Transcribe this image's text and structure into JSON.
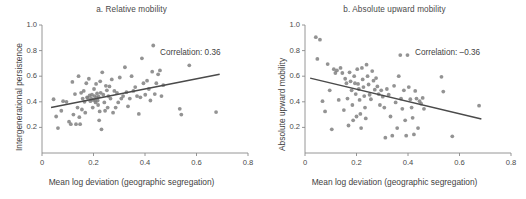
{
  "figure": {
    "background": "#ffffff",
    "point_color": "#808080",
    "line_color": "#4a4a4a",
    "axis_color": "#8a8a8a",
    "text_color": "#3f3f3f"
  },
  "panels": [
    {
      "id": "a",
      "title": "a. Relative mobility",
      "annotation": "Correlation: 0.36",
      "xlabel": "Mean log deviation (geographic segregation)",
      "ylabel": "Intergenerational persistence",
      "xticks": [
        "0",
        "0.2",
        "0.4",
        "0.6",
        "0.8"
      ],
      "yticks": [
        "0.2",
        "0.4",
        "0.6",
        "0.8",
        "1.0"
      ]
    },
    {
      "id": "b",
      "title": "b. Absolute upward mobility",
      "annotation": "Correlation: –0.36",
      "xlabel": "Mean log deviation (geographic segregation)",
      "ylabel": "Absolute upward mobility",
      "xticks": [
        "0",
        "0.2",
        "0.4",
        "0.6",
        "0.8"
      ],
      "yticks": [
        "0.2",
        "0.4",
        "0.6",
        "0.8",
        "1.0"
      ]
    }
  ],
  "chart_data": [
    {
      "type": "scatter",
      "title": "a. Relative mobility",
      "xlabel": "Mean log deviation (geographic segregation)",
      "ylabel": "Intergenerational persistence",
      "xlim": [
        0,
        0.8
      ],
      "ylim": [
        0,
        1.0
      ],
      "xticks": [
        0,
        0.2,
        0.4,
        0.6,
        0.8
      ],
      "yticks": [
        0.2,
        0.4,
        0.6,
        0.8,
        1.0
      ],
      "grid": false,
      "legend": "none",
      "annotation": "Correlation: 0.36",
      "correlation": 0.36,
      "trendline": {
        "x": [
          0.035,
          0.69
        ],
        "y": [
          0.355,
          0.615
        ]
      },
      "points": [
        [
          0.045,
          0.42
        ],
        [
          0.055,
          0.285
        ],
        [
          0.062,
          0.195
        ],
        [
          0.075,
          0.33
        ],
        [
          0.082,
          0.405
        ],
        [
          0.095,
          0.4
        ],
        [
          0.105,
          0.245
        ],
        [
          0.112,
          0.225
        ],
        [
          0.118,
          0.555
        ],
        [
          0.122,
          0.3
        ],
        [
          0.128,
          0.46
        ],
        [
          0.132,
          0.225
        ],
        [
          0.138,
          0.355
        ],
        [
          0.142,
          0.6
        ],
        [
          0.145,
          0.28
        ],
        [
          0.148,
          0.225
        ],
        [
          0.152,
          0.47
        ],
        [
          0.155,
          0.34
        ],
        [
          0.158,
          0.425
        ],
        [
          0.162,
          0.485
        ],
        [
          0.165,
          0.4
        ],
        [
          0.168,
          0.315
        ],
        [
          0.172,
          0.545
        ],
        [
          0.175,
          0.435
        ],
        [
          0.178,
          0.43
        ],
        [
          0.182,
          0.58
        ],
        [
          0.185,
          0.45
        ],
        [
          0.188,
          0.405
        ],
        [
          0.191,
          0.425
        ],
        [
          0.194,
          0.455
        ],
        [
          0.197,
          0.355
        ],
        [
          0.199,
          0.415
        ],
        [
          0.202,
          0.5
        ],
        [
          0.204,
          0.445
        ],
        [
          0.206,
          0.41
        ],
        [
          0.208,
          0.395
        ],
        [
          0.21,
          0.54
        ],
        [
          0.212,
          0.435
        ],
        [
          0.214,
          0.465
        ],
        [
          0.216,
          0.41
        ],
        [
          0.218,
          0.375
        ],
        [
          0.22,
          0.44
        ],
        [
          0.222,
          0.255
        ],
        [
          0.224,
          0.325
        ],
        [
          0.226,
          0.56
        ],
        [
          0.228,
          0.47
        ],
        [
          0.231,
          0.185
        ],
        [
          0.234,
          0.63
        ],
        [
          0.238,
          0.455
        ],
        [
          0.242,
          0.395
        ],
        [
          0.245,
          0.33
        ],
        [
          0.248,
          0.525
        ],
        [
          0.252,
          0.49
        ],
        [
          0.255,
          0.355
        ],
        [
          0.258,
          0.445
        ],
        [
          0.262,
          0.52
        ],
        [
          0.266,
          0.425
        ],
        [
          0.271,
          0.575
        ],
        [
          0.276,
          0.315
        ],
        [
          0.281,
          0.485
        ],
        [
          0.286,
          0.355
        ],
        [
          0.291,
          0.47
        ],
        [
          0.296,
          0.395
        ],
        [
          0.302,
          0.59
        ],
        [
          0.308,
          0.425
        ],
        [
          0.315,
          0.445
        ],
        [
          0.322,
          0.67
        ],
        [
          0.328,
          0.475
        ],
        [
          0.334,
          0.365
        ],
        [
          0.341,
          0.425
        ],
        [
          0.348,
          0.6
        ],
        [
          0.355,
          0.485
        ],
        [
          0.362,
          0.515
        ],
        [
          0.369,
          0.445
        ],
        [
          0.376,
          0.305
        ],
        [
          0.382,
          0.435
        ],
        [
          0.388,
          0.74
        ],
        [
          0.394,
          0.545
        ],
        [
          0.401,
          0.455
        ],
        [
          0.408,
          0.565
        ],
        [
          0.415,
          0.5
        ],
        [
          0.421,
          0.41
        ],
        [
          0.428,
          0.635
        ],
        [
          0.432,
          0.84
        ],
        [
          0.438,
          0.46
        ],
        [
          0.444,
          0.545
        ],
        [
          0.451,
          0.615
        ],
        [
          0.458,
          0.645
        ],
        [
          0.464,
          0.445
        ],
        [
          0.471,
          0.53
        ],
        [
          0.535,
          0.345
        ],
        [
          0.541,
          0.3
        ],
        [
          0.572,
          0.685
        ],
        [
          0.676,
          0.32
        ]
      ]
    },
    {
      "type": "scatter",
      "title": "b. Absolute upward mobility",
      "xlabel": "Mean log deviation (geographic segregation)",
      "ylabel": "Absolute upward mobility",
      "xlim": [
        0,
        0.8
      ],
      "ylim": [
        0,
        1.0
      ],
      "xticks": [
        0,
        0.2,
        0.4,
        0.6,
        0.8
      ],
      "yticks": [
        0.2,
        0.4,
        0.6,
        0.8,
        1.0
      ],
      "grid": false,
      "legend": "none",
      "annotation": "Correlation: –0.36",
      "correlation": -0.36,
      "trendline": {
        "x": [
          0.02,
          0.685
        ],
        "y": [
          0.585,
          0.265
        ]
      },
      "points": [
        [
          0.042,
          0.905
        ],
        [
          0.048,
          0.735
        ],
        [
          0.058,
          0.885
        ],
        [
          0.068,
          0.405
        ],
        [
          0.078,
          0.325
        ],
        [
          0.088,
          0.695
        ],
        [
          0.096,
          0.49
        ],
        [
          0.104,
          0.185
        ],
        [
          0.112,
          0.655
        ],
        [
          0.118,
          0.625
        ],
        [
          0.124,
          0.645
        ],
        [
          0.131,
          0.415
        ],
        [
          0.138,
          0.665
        ],
        [
          0.145,
          0.625
        ],
        [
          0.151,
          0.335
        ],
        [
          0.156,
          0.58
        ],
        [
          0.161,
          0.545
        ],
        [
          0.165,
          0.425
        ],
        [
          0.169,
          0.215
        ],
        [
          0.173,
          0.63
        ],
        [
          0.177,
          0.56
        ],
        [
          0.181,
          0.49
        ],
        [
          0.184,
          0.375
        ],
        [
          0.187,
          0.255
        ],
        [
          0.191,
          0.6
        ],
        [
          0.194,
          0.545
        ],
        [
          0.197,
          0.46
        ],
        [
          0.2,
          0.285
        ],
        [
          0.203,
          0.655
        ],
        [
          0.206,
          0.54
        ],
        [
          0.209,
          0.5
        ],
        [
          0.212,
          0.415
        ],
        [
          0.215,
          0.305
        ],
        [
          0.218,
          0.195
        ],
        [
          0.221,
          0.665
        ],
        [
          0.224,
          0.575
        ],
        [
          0.227,
          0.515
        ],
        [
          0.23,
          0.445
        ],
        [
          0.233,
          0.355
        ],
        [
          0.236,
          0.27
        ],
        [
          0.239,
          0.69
        ],
        [
          0.243,
          0.6
        ],
        [
          0.247,
          0.535
        ],
        [
          0.251,
          0.455
        ],
        [
          0.256,
          0.42
        ],
        [
          0.261,
          0.64
        ],
        [
          0.266,
          0.565
        ],
        [
          0.271,
          0.495
        ],
        [
          0.276,
          0.585
        ],
        [
          0.281,
          0.52
        ],
        [
          0.286,
          0.46
        ],
        [
          0.291,
          0.375
        ],
        [
          0.296,
          0.49
        ],
        [
          0.302,
          0.44
        ],
        [
          0.308,
          0.355
        ],
        [
          0.312,
          0.12
        ],
        [
          0.318,
          0.5
        ],
        [
          0.325,
          0.455
        ],
        [
          0.332,
          0.285
        ],
        [
          0.339,
          0.135
        ],
        [
          0.346,
          0.525
        ],
        [
          0.352,
          0.395
        ],
        [
          0.358,
          0.195
        ],
        [
          0.364,
          0.6
        ],
        [
          0.37,
          0.765
        ],
        [
          0.373,
          0.425
        ],
        [
          0.378,
          0.345
        ],
        [
          0.384,
          0.49
        ],
        [
          0.389,
          0.255
        ],
        [
          0.393,
          0.135
        ],
        [
          0.398,
          0.765
        ],
        [
          0.403,
          0.515
        ],
        [
          0.409,
          0.42
        ],
        [
          0.414,
          0.355
        ],
        [
          0.418,
          0.275
        ],
        [
          0.423,
          0.145
        ],
        [
          0.428,
          0.485
        ],
        [
          0.433,
          0.425
        ],
        [
          0.439,
          0.195
        ],
        [
          0.445,
          0.405
        ],
        [
          0.451,
          0.385
        ],
        [
          0.457,
          0.43
        ],
        [
          0.462,
          0.345
        ],
        [
          0.53,
          0.595
        ],
        [
          0.537,
          0.48
        ],
        [
          0.572,
          0.13
        ],
        [
          0.676,
          0.37
        ]
      ]
    }
  ]
}
